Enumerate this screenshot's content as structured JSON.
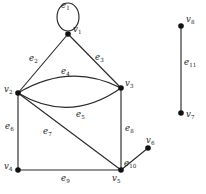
{
  "figure": {
    "kind": "undirected-multigraph",
    "background_color": "#ffffff",
    "stroke_color": "#2b2b2b",
    "vertex_color": "#111111",
    "width": 206,
    "height": 194
  },
  "vertices": [
    {
      "id": "v1",
      "name": "v",
      "sub": "1",
      "x": 68,
      "y": 34,
      "label_dx": 5,
      "label_dy": -10
    },
    {
      "id": "v2",
      "name": "v",
      "sub": "2",
      "x": 18,
      "y": 93,
      "label_dx": -14,
      "label_dy": -9
    },
    {
      "id": "v3",
      "name": "v",
      "sub": "3",
      "x": 121,
      "y": 88,
      "label_dx": 4,
      "label_dy": -10
    },
    {
      "id": "v4",
      "name": "v",
      "sub": "4",
      "x": 18,
      "y": 170,
      "label_dx": -14,
      "label_dy": -9
    },
    {
      "id": "v5",
      "name": "v",
      "sub": "5",
      "x": 121,
      "y": 170,
      "label_dx": -3,
      "label_dy": 2
    },
    {
      "id": "v6",
      "name": "v",
      "sub": "6",
      "x": 148,
      "y": 148,
      "label_dx": -1,
      "label_dy": -12
    },
    {
      "id": "v7",
      "name": "v",
      "sub": "7",
      "x": 181,
      "y": 113,
      "label_dx": 4,
      "label_dy": -4
    },
    {
      "id": "v8",
      "name": "v",
      "sub": "8",
      "x": 181,
      "y": 26,
      "label_dx": 4,
      "label_dy": -11
    }
  ],
  "edges": [
    {
      "id": "e1",
      "name": "e",
      "sub": "1",
      "from": "v1",
      "to": "v1",
      "kind": "self-loop",
      "label_x": 61,
      "label_y": 2
    },
    {
      "id": "e2",
      "name": "e",
      "sub": "2",
      "from": "v1",
      "to": "v2",
      "kind": "straight",
      "label_x": 31,
      "label_y": 57
    },
    {
      "id": "e3",
      "name": "e",
      "sub": "3",
      "from": "v1",
      "to": "v3",
      "kind": "straight",
      "label_x": 96,
      "label_y": 56
    },
    {
      "id": "e4",
      "name": "e",
      "sub": "4",
      "from": "v2",
      "to": "v3",
      "kind": "curve-up",
      "label_x": 62,
      "label_y": 71
    },
    {
      "id": "e5",
      "name": "e",
      "sub": "5",
      "from": "v2",
      "to": "v3",
      "kind": "curve-down",
      "label_x": 76,
      "label_y": 114
    },
    {
      "id": "e6",
      "name": "e",
      "sub": "6",
      "from": "v2",
      "to": "v4",
      "kind": "straight",
      "label_x": 6,
      "label_y": 126
    },
    {
      "id": "e7",
      "name": "e",
      "sub": "7",
      "from": "v2",
      "to": "v5",
      "kind": "straight",
      "label_x": 44,
      "label_y": 131
    },
    {
      "id": "e8",
      "name": "e",
      "sub": "8",
      "from": "v3",
      "to": "v5",
      "kind": "straight",
      "label_x": 125,
      "label_y": 128
    },
    {
      "id": "e9",
      "name": "e",
      "sub": "9",
      "from": "v4",
      "to": "v5",
      "kind": "straight",
      "label_x": 62,
      "label_y": 177
    },
    {
      "id": "e10",
      "name": "e",
      "sub": "10",
      "from": "v5",
      "to": "v6",
      "kind": "straight",
      "label_x": 124,
      "label_y": 161
    },
    {
      "id": "e11",
      "name": "e",
      "sub": "11",
      "from": "v8",
      "to": "v7",
      "kind": "straight",
      "label_x": 185,
      "label_y": 61
    }
  ],
  "geometry": {
    "self_loop": {
      "cx": 68,
      "cy": 17,
      "rx": 11,
      "ry": 14
    },
    "straight_edges": [
      {
        "id": "e2",
        "x1": 68,
        "y1": 34,
        "x2": 18,
        "y2": 93
      },
      {
        "id": "e3",
        "x1": 68,
        "y1": 34,
        "x2": 121,
        "y2": 88
      },
      {
        "id": "e6",
        "x1": 18,
        "y1": 93,
        "x2": 18,
        "y2": 170
      },
      {
        "id": "e7",
        "x1": 18,
        "y1": 93,
        "x2": 121,
        "y2": 170
      },
      {
        "id": "e8",
        "x1": 121,
        "y1": 88,
        "x2": 121,
        "y2": 170
      },
      {
        "id": "e9",
        "x1": 18,
        "y1": 170,
        "x2": 121,
        "y2": 170
      },
      {
        "id": "e10",
        "x1": 121,
        "y1": 170,
        "x2": 148,
        "y2": 148
      },
      {
        "id": "e11",
        "x1": 181,
        "y1": 26,
        "x2": 181,
        "y2": 113
      }
    ],
    "curved_edges": [
      {
        "id": "e4",
        "path": "M18,93 Q70,62 121,88"
      },
      {
        "id": "e5",
        "path": "M18,93 Q70,124 121,88"
      }
    ],
    "vertex_radius": 2.6
  }
}
